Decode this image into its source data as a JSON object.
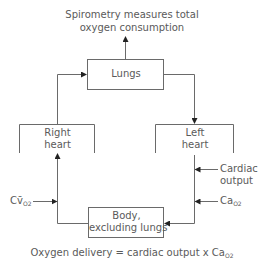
{
  "title": {
    "line1": "Spirometry measures total",
    "line2": "oxygen consumption"
  },
  "nodes": {
    "lungs": "Lungs",
    "right_heart": {
      "line1": "Right",
      "line2": "heart"
    },
    "left_heart": {
      "line1": "Left",
      "line2": "heart"
    },
    "body": {
      "line1": "Body,",
      "line2": "excluding lungs"
    }
  },
  "inputs": {
    "cardiac_output": {
      "line1": "Cardiac",
      "line2": "output"
    },
    "cao2": {
      "main": "Ca",
      "sub": "O2"
    },
    "cvo2": {
      "main": "Cv̄",
      "sub": "O2"
    }
  },
  "formula": {
    "text": "Oxygen delivery = cardiac output x Ca",
    "sub": "O2"
  },
  "colors": {
    "line": "#5a5a5a",
    "text": "#5a5a5a"
  }
}
